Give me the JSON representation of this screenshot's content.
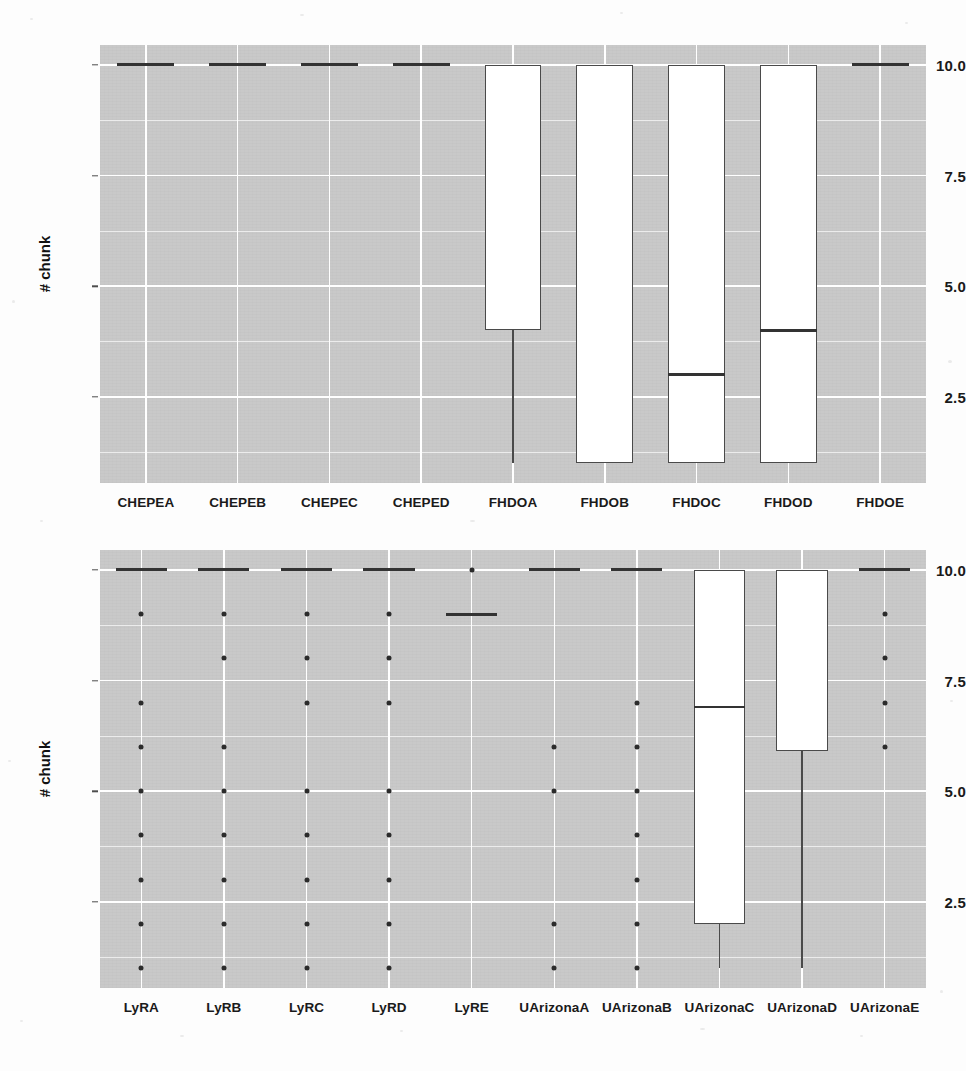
{
  "figure": {
    "background_color": "#fdfdfd",
    "panel_fill": "#c9c9c9",
    "gridline_color": "#ffffff",
    "box_fill": "#ffffff",
    "box_line_color": "#4a4a4a",
    "point_color": "#2b2b2b"
  },
  "chart_data": [
    {
      "type": "box",
      "panel": "top",
      "title": "",
      "xlabel": "",
      "ylabel": "# chunk",
      "ylim": [
        0.55,
        10.45
      ],
      "yticks": [
        2.5,
        5.0,
        7.5,
        10.0
      ],
      "ytick_labels": [
        "2.5",
        "5.0",
        "7.5",
        "10.0"
      ],
      "yminor": [
        1.25,
        3.75,
        6.25,
        8.75
      ],
      "grid": true,
      "legend": "none",
      "categories": [
        "CHEPEA",
        "CHEPEB",
        "CHEPEC",
        "CHEPED",
        "FHDOA",
        "FHDOB",
        "FHDOC",
        "FHDOD",
        "FHDOE"
      ],
      "boxes": [
        {
          "category": "CHEPEA",
          "q1": 10,
          "median": 10,
          "q3": 10,
          "lower_whisker": 10,
          "upper_whisker": 10,
          "outliers": [],
          "degenerate": true
        },
        {
          "category": "CHEPEB",
          "q1": 10,
          "median": 10,
          "q3": 10,
          "lower_whisker": 10,
          "upper_whisker": 10,
          "outliers": [],
          "degenerate": true
        },
        {
          "category": "CHEPEC",
          "q1": 10,
          "median": 10,
          "q3": 10,
          "lower_whisker": 10,
          "upper_whisker": 10,
          "outliers": [],
          "degenerate": true
        },
        {
          "category": "CHEPED",
          "q1": 10,
          "median": 10,
          "q3": 10,
          "lower_whisker": 10,
          "upper_whisker": 10,
          "outliers": [],
          "degenerate": true
        },
        {
          "category": "FHDOA",
          "q1": 4,
          "median": 10,
          "q3": 10,
          "lower_whisker": 1,
          "upper_whisker": 10,
          "outliers": [],
          "degenerate": false
        },
        {
          "category": "FHDOB",
          "q1": 1,
          "median": 10,
          "q3": 10,
          "lower_whisker": 1,
          "upper_whisker": 10,
          "outliers": [],
          "degenerate": false
        },
        {
          "category": "FHDOC",
          "q1": 1,
          "median": 3,
          "q3": 10,
          "lower_whisker": 1,
          "upper_whisker": 10,
          "outliers": [],
          "degenerate": false
        },
        {
          "category": "FHDOD",
          "q1": 1,
          "median": 4,
          "q3": 10,
          "lower_whisker": 1,
          "upper_whisker": 10,
          "outliers": [],
          "degenerate": false
        },
        {
          "category": "FHDOE",
          "q1": 10,
          "median": 10,
          "q3": 10,
          "lower_whisker": 10,
          "upper_whisker": 10,
          "outliers": [],
          "degenerate": true
        }
      ]
    },
    {
      "type": "box",
      "panel": "bottom",
      "title": "",
      "xlabel": "",
      "ylabel": "# chunk",
      "ylim": [
        0.55,
        10.45
      ],
      "yticks": [
        2.5,
        5.0,
        7.5,
        10.0
      ],
      "ytick_labels": [
        "2.5",
        "5.0",
        "7.5",
        "10.0"
      ],
      "yminor": [
        1.25,
        3.75,
        6.25,
        8.75
      ],
      "grid": true,
      "legend": "none",
      "categories": [
        "LyRA",
        "LyRB",
        "LyRC",
        "LyRD",
        "LyRE",
        "UArizonaA",
        "UArizonaB",
        "UArizonaC",
        "UArizonaD",
        "UArizonaE"
      ],
      "boxes": [
        {
          "category": "LyRA",
          "q1": 10,
          "median": 10,
          "q3": 10,
          "lower_whisker": 10,
          "upper_whisker": 10,
          "outliers": [
            9,
            7,
            6,
            5,
            4,
            3,
            2,
            1
          ],
          "degenerate": true
        },
        {
          "category": "LyRB",
          "q1": 10,
          "median": 10,
          "q3": 10,
          "lower_whisker": 10,
          "upper_whisker": 10,
          "outliers": [
            9,
            8,
            6,
            5,
            4,
            3,
            2,
            1
          ],
          "degenerate": true
        },
        {
          "category": "LyRC",
          "q1": 10,
          "median": 10,
          "q3": 10,
          "lower_whisker": 10,
          "upper_whisker": 10,
          "outliers": [
            9,
            8,
            7,
            5,
            4,
            3,
            2,
            1
          ],
          "degenerate": true
        },
        {
          "category": "LyRD",
          "q1": 10,
          "median": 10,
          "q3": 10,
          "lower_whisker": 10,
          "upper_whisker": 10,
          "outliers": [
            9,
            8,
            7,
            5,
            4,
            3,
            2,
            1
          ],
          "degenerate": true
        },
        {
          "category": "LyRE",
          "q1": 9,
          "median": 9,
          "q3": 9,
          "lower_whisker": 9,
          "upper_whisker": 9,
          "outliers": [
            10
          ],
          "degenerate": true
        },
        {
          "category": "UArizonaA",
          "q1": 10,
          "median": 10,
          "q3": 10,
          "lower_whisker": 10,
          "upper_whisker": 10,
          "outliers": [
            6,
            5,
            2,
            1
          ],
          "degenerate": true
        },
        {
          "category": "UArizonaB",
          "q1": 10,
          "median": 10,
          "q3": 10,
          "lower_whisker": 10,
          "upper_whisker": 10,
          "outliers": [
            7,
            6,
            5,
            4,
            3,
            2,
            1
          ],
          "degenerate": true
        },
        {
          "category": "UArizonaC",
          "q1": 2,
          "median": 6.9,
          "q3": 10,
          "lower_whisker": 1,
          "upper_whisker": 10,
          "outliers": [],
          "degenerate": false
        },
        {
          "category": "UArizonaD",
          "q1": 5.9,
          "median": 10,
          "q3": 10,
          "lower_whisker": 1,
          "upper_whisker": 10,
          "outliers": [],
          "degenerate": false
        },
        {
          "category": "UArizonaE",
          "q1": 10,
          "median": 10,
          "q3": 10,
          "lower_whisker": 10,
          "upper_whisker": 10,
          "outliers": [
            9,
            8,
            7,
            6
          ],
          "degenerate": true
        }
      ]
    }
  ]
}
